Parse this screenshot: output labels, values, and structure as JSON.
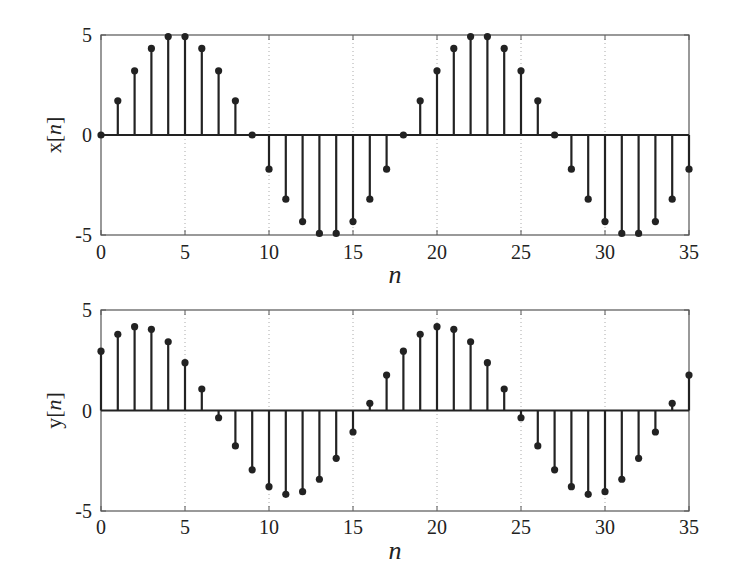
{
  "chart_data": [
    {
      "type": "stem",
      "title": "",
      "xlabel": "n",
      "ylabel": "x[n]",
      "ylabel_parts": {
        "prefix": "x[",
        "var": "n",
        "suffix": "]"
      },
      "xlim": [
        0,
        35
      ],
      "ylim": [
        -5,
        5
      ],
      "xticks": [
        0,
        5,
        10,
        15,
        20,
        25,
        30,
        35
      ],
      "yticks": [
        -5,
        0,
        5
      ],
      "grid": {
        "x": true,
        "y": false,
        "style": "dotted"
      },
      "legend": null,
      "x": [
        0,
        1,
        2,
        3,
        4,
        5,
        6,
        7,
        8,
        9,
        10,
        11,
        12,
        13,
        14,
        15,
        16,
        17,
        18,
        19,
        20,
        21,
        22,
        23,
        24,
        25,
        26,
        27,
        28,
        29,
        30,
        31,
        32,
        33,
        34,
        35
      ],
      "values": [
        0,
        1.71,
        3.21,
        4.33,
        4.92,
        4.92,
        4.33,
        3.21,
        1.71,
        0,
        -1.71,
        -3.21,
        -4.33,
        -4.92,
        -4.92,
        -4.33,
        -3.21,
        -1.71,
        0,
        1.71,
        3.21,
        4.33,
        4.92,
        4.92,
        4.33,
        3.21,
        1.71,
        0,
        -1.71,
        -3.21,
        -4.33,
        -4.92,
        -4.92,
        -4.33,
        -3.21,
        -1.71
      ]
    },
    {
      "type": "stem",
      "title": "",
      "xlabel": "n",
      "ylabel": "y[n]",
      "ylabel_parts": {
        "prefix": "y[",
        "var": "n",
        "suffix": "]"
      },
      "xlim": [
        0,
        35
      ],
      "ylim": [
        -5,
        5
      ],
      "xticks": [
        0,
        5,
        10,
        15,
        20,
        25,
        30,
        35
      ],
      "yticks": [
        -5,
        0,
        5
      ],
      "grid": {
        "x": true,
        "y": false,
        "style": "dotted"
      },
      "legend": null,
      "x": [
        0,
        1,
        2,
        3,
        4,
        5,
        6,
        7,
        8,
        9,
        10,
        11,
        12,
        13,
        14,
        15,
        16,
        17,
        18,
        19,
        20,
        21,
        22,
        23,
        24,
        25,
        26,
        27,
        28,
        29,
        30,
        31,
        32,
        33,
        34,
        35
      ],
      "values": [
        2.95,
        3.79,
        4.17,
        4.04,
        3.42,
        2.38,
        1.07,
        -0.36,
        -1.76,
        -2.95,
        -3.79,
        -4.17,
        -4.04,
        -3.42,
        -2.38,
        -1.07,
        0.36,
        1.76,
        2.95,
        3.79,
        4.17,
        4.04,
        3.42,
        2.38,
        1.07,
        -0.36,
        -1.76,
        -2.95,
        -3.79,
        -4.17,
        -4.04,
        -3.42,
        -2.38,
        -1.07,
        0.36,
        1.76
      ]
    }
  ],
  "style": {
    "stem_color": "#222222",
    "axis_color": "#555555",
    "grid_color": "#aaaaaa",
    "background": "#ffffff"
  }
}
